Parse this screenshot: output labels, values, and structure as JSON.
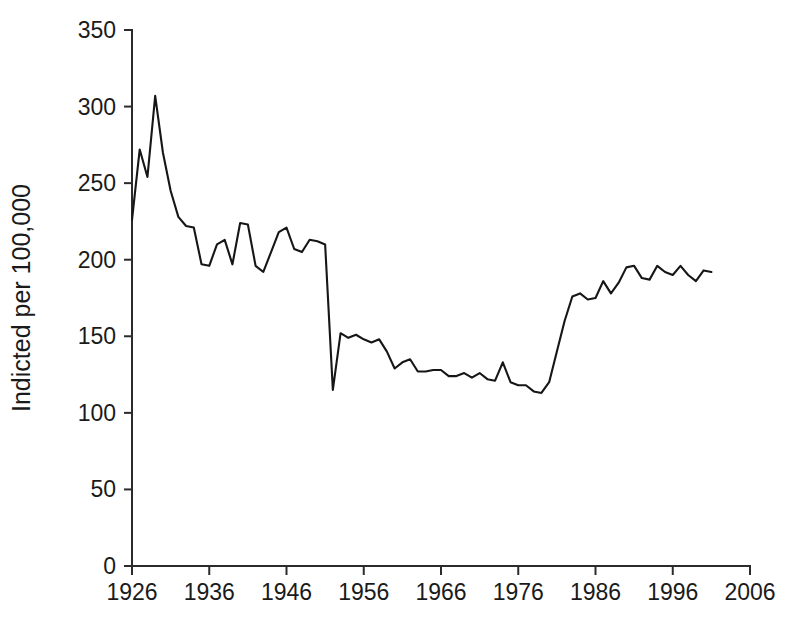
{
  "figure": {
    "background_color": "#ffffff",
    "line_color": "#161616",
    "axis_color": "#2b2b2b"
  },
  "chart_data": {
    "type": "line",
    "title": "",
    "xlabel": "",
    "ylabel": "Indicted per 100,000",
    "xlim": [
      1926,
      2006
    ],
    "ylim": [
      0,
      350
    ],
    "grid": false,
    "legend": null,
    "xticks": [
      1926,
      1936,
      1946,
      1956,
      1966,
      1976,
      1986,
      1996,
      2006
    ],
    "xtick_labels": [
      "1926",
      "1936",
      "1946",
      "1956",
      "1966",
      "1976",
      "1986",
      "1996",
      "2006"
    ],
    "yticks": [
      0,
      50,
      100,
      150,
      200,
      250,
      300,
      350
    ],
    "ytick_labels": [
      "0",
      "50",
      "100",
      "150",
      "200",
      "250",
      "300",
      "350"
    ],
    "series": [
      {
        "name": "Indicted per 100,000",
        "x": [
          1926,
          1927,
          1928,
          1929,
          1930,
          1931,
          1932,
          1933,
          1934,
          1935,
          1936,
          1937,
          1938,
          1939,
          1940,
          1941,
          1942,
          1943,
          1944,
          1945,
          1946,
          1947,
          1948,
          1949,
          1950,
          1951,
          1952,
          1953,
          1954,
          1955,
          1956,
          1957,
          1958,
          1959,
          1960,
          1961,
          1962,
          1963,
          1964,
          1965,
          1966,
          1967,
          1968,
          1969,
          1970,
          1971,
          1972,
          1973,
          1974,
          1975,
          1976,
          1977,
          1978,
          1979,
          1980,
          1981,
          1982,
          1983,
          1984,
          1985,
          1986,
          1987,
          1988,
          1989,
          1990,
          1991,
          1992,
          1993,
          1994,
          1995,
          1996,
          1997,
          1998,
          1999,
          2000,
          2001
        ],
        "values": [
          226,
          272,
          254,
          307,
          270,
          245,
          228,
          222,
          221,
          197,
          196,
          210,
          213,
          197,
          224,
          223,
          196,
          192,
          205,
          218,
          221,
          207,
          205,
          213,
          212,
          210,
          115,
          152,
          149,
          151,
          148,
          146,
          148,
          140,
          129,
          133,
          135,
          127,
          127,
          128,
          128,
          124,
          124,
          126,
          123,
          126,
          122,
          121,
          133,
          120,
          118,
          118,
          114,
          113,
          120,
          140,
          160,
          176,
          178,
          174,
          175,
          186,
          178,
          185,
          195,
          196,
          188,
          187,
          196,
          192,
          190,
          196,
          190,
          186,
          193,
          192
        ]
      }
    ]
  }
}
